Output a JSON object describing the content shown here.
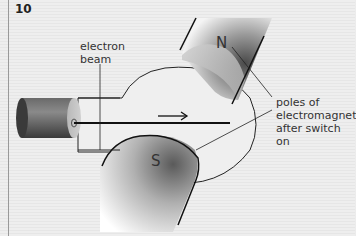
{
  "figure": {
    "number": "10",
    "labels": {
      "electron_beam_line1": "electron",
      "electron_beam_line2": "beam",
      "north_pole": "N",
      "south_pole": "S",
      "poles_line1": "poles of",
      "poles_line2": "electromagnet",
      "poles_line3": "after switch on"
    },
    "arrow_direction": "right"
  }
}
